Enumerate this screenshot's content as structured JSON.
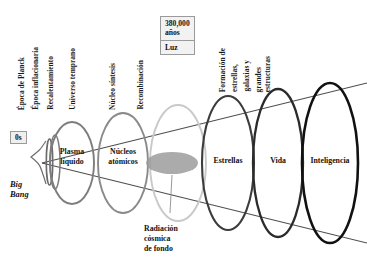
{
  "diagram": {
    "type": "cosmic-timeline-cone",
    "epoch_labels": [
      {
        "text": "Época de Planck",
        "x": 22,
        "y_bottom": 110
      },
      {
        "text": "Época inflacionaria",
        "x": 36,
        "y_bottom": 110
      },
      {
        "text": "Recalentamiento",
        "x": 51,
        "y_bottom": 110
      },
      {
        "text": "Universo temprano",
        "x": 73,
        "y_bottom": 110
      },
      {
        "text": "Núcleo síntesis",
        "x": 113,
        "y_bottom": 110
      },
      {
        "text": "Recombinación",
        "x": 141,
        "y_bottom": 110
      }
    ],
    "formation_block": [
      "Formación de",
      "estrellas,",
      "galaxias y",
      "grandes",
      "estructuras"
    ],
    "time_box": {
      "line1": "380,000",
      "line2": "años",
      "light_label": "Luz"
    },
    "zero_label": "0s",
    "big_bang": {
      "line1": "Big",
      "line2": "Bang"
    },
    "cmb_caption": {
      "line1": "Radiación",
      "line2": "cósmica",
      "line3": "de fondo"
    },
    "rings": [
      {
        "name": "plasma",
        "label_line1": "Plasma",
        "label_line2": "líquido",
        "cx": 72,
        "cy": 163,
        "rx": 22,
        "ry": 41,
        "color": "#7d7d7d",
        "stroke_width": 1.9
      },
      {
        "name": "nucleos",
        "label_line1": "Núcleos",
        "label_line2": "atómicos",
        "cx": 123,
        "cy": 163,
        "rx": 25,
        "ry": 50,
        "color": "#8a8a8a",
        "stroke_width": 1.9
      },
      {
        "name": "cmb-surface",
        "label_line1": "",
        "label_line2": "",
        "cx": 178,
        "cy": 163,
        "rx": 28,
        "ry": 58,
        "color": "#c9c9c9",
        "stroke_width": 1.9
      },
      {
        "name": "estrellas",
        "label_line1": "Estrellas",
        "label_line2": "",
        "cx": 228,
        "cy": 163,
        "rx": 26,
        "ry": 67,
        "color": "#3c3c3c",
        "stroke_width": 2.1
      },
      {
        "name": "vida",
        "label_line1": "Vida",
        "label_line2": "",
        "cx": 278,
        "cy": 163,
        "rx": 25,
        "ry": 74,
        "color": "#2b2b2b",
        "stroke_width": 2.3
      },
      {
        "name": "inteligencia",
        "label_line1": "Inteligencia",
        "label_line2": "",
        "cx": 330,
        "cy": 163,
        "rx": 28,
        "ry": 80,
        "color": "#111111",
        "stroke_width": 2.6
      }
    ],
    "colors": {
      "cone_line": "#555555",
      "cmb_blob": "#9a9a9a",
      "text": "#111111",
      "box_border": "#9a9a9a",
      "box_fill": "#f0f0f0"
    }
  }
}
